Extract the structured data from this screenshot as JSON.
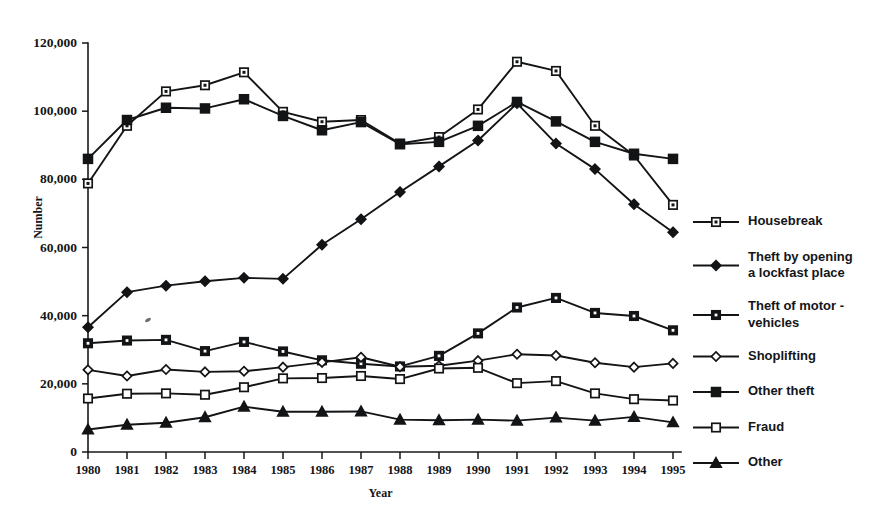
{
  "chart_data": {
    "type": "line",
    "title": "",
    "xlabel": "Year",
    "ylabel": "Number",
    "grid": false,
    "legend_position": "right",
    "xlim": [
      1980,
      1995
    ],
    "ylim": [
      0,
      120000
    ],
    "ytick_values": [
      0,
      20000,
      40000,
      60000,
      80000,
      100000,
      120000
    ],
    "ytick_labels": [
      "0",
      "20,000",
      "40,000",
      "60,000",
      "80,000",
      "100,000",
      "120,000"
    ],
    "categories": [
      1980,
      1981,
      1982,
      1983,
      1984,
      1985,
      1986,
      1987,
      1988,
      1989,
      1990,
      1991,
      1992,
      1993,
      1994,
      1995
    ],
    "xtick_labels": [
      "1980",
      "1981",
      "1982",
      "1983",
      "1984",
      "1985",
      "1986",
      "1987",
      "1988",
      "1989",
      "1990",
      "1991",
      "1992",
      "1993",
      "1994",
      "1995"
    ],
    "series": [
      {
        "name": "Housebreak",
        "marker": "square-dotted",
        "values": [
          78800,
          95700,
          105800,
          107600,
          111400,
          99800,
          96900,
          97400,
          90500,
          92400,
          100500,
          114500,
          111800,
          95700,
          87000,
          72500
        ]
      },
      {
        "name": "Theft by opening a lockfast place",
        "marker": "diamond-solid",
        "values": [
          36600,
          46900,
          48800,
          50100,
          51100,
          50800,
          60800,
          68300,
          76300,
          83800,
          91400,
          102300,
          90500,
          83000,
          72700,
          64500
        ]
      },
      {
        "name": "Theft of motor - vehicles",
        "marker": "square-dotted-small",
        "values": [
          31900,
          32700,
          32900,
          29600,
          32300,
          29500,
          26900,
          25900,
          25100,
          28200,
          34800,
          42400,
          45200,
          40800,
          39900,
          35700
        ]
      },
      {
        "name": "Shoplifting",
        "marker": "diamond-open",
        "values": [
          24100,
          22300,
          24200,
          23500,
          23700,
          24900,
          26300,
          27800,
          25000,
          25300,
          26800,
          28700,
          28300,
          26200,
          24900,
          26000
        ]
      },
      {
        "name": "Other theft",
        "marker": "square-solid",
        "values": [
          86000,
          97400,
          101000,
          100800,
          103500,
          98600,
          94400,
          96800,
          90300,
          91000,
          95700,
          102700,
          97000,
          91000,
          87500,
          86000
        ]
      },
      {
        "name": "Fraud",
        "marker": "square-open",
        "values": [
          15700,
          17100,
          17200,
          16800,
          19000,
          21600,
          21700,
          22300,
          21400,
          24500,
          24700,
          20200,
          20800,
          17200,
          15500,
          15100
        ]
      },
      {
        "name": "Other",
        "marker": "triangle-solid",
        "values": [
          6600,
          8000,
          8600,
          10200,
          13300,
          11800,
          11800,
          11900,
          9500,
          9300,
          9500,
          9200,
          10100,
          9200,
          10300,
          8700
        ]
      }
    ],
    "legend_entries": [
      {
        "label_lines": [
          "Housebreak"
        ],
        "marker": "square-dotted"
      },
      {
        "label_lines": [
          "Theft by opening",
          "a lockfast place"
        ],
        "marker": "diamond-solid"
      },
      {
        "label_lines": [
          "Theft of motor -",
          "vehicles"
        ],
        "marker": "square-dotted-small"
      },
      {
        "label_lines": [
          "Shoplifting"
        ],
        "marker": "diamond-open"
      },
      {
        "label_lines": [
          "Other theft"
        ],
        "marker": "square-solid"
      },
      {
        "label_lines": [
          "Fraud"
        ],
        "marker": "square-open"
      },
      {
        "label_lines": [
          "Other"
        ],
        "marker": "triangle-solid"
      }
    ],
    "colors": {
      "ink": "#131416",
      "background": "#ffffff"
    }
  }
}
